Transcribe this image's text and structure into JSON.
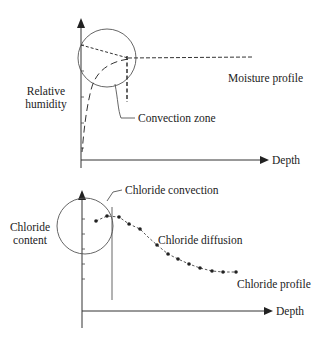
{
  "diagram": {
    "top_panel": {
      "y_axis_label_line1": "Relative",
      "y_axis_label_line2": "humidity",
      "x_axis_label": "Depth",
      "curve_label": "Moisture profile",
      "zone_label": "Convection zone"
    },
    "bottom_panel": {
      "y_axis_label_line1": "Chloride",
      "y_axis_label_line2": "content",
      "x_axis_label": "Depth",
      "convection_label": "Chloride convection",
      "diffusion_label": "Chloride diffusion",
      "curve_label": "Chloride profile",
      "profile_points": [
        [
          96,
          221
        ],
        [
          107,
          216
        ],
        [
          119,
          217
        ],
        [
          129,
          224
        ],
        [
          140,
          229
        ],
        [
          148,
          237
        ],
        [
          157,
          245
        ],
        [
          168,
          254
        ],
        [
          178,
          259
        ],
        [
          189,
          264
        ],
        [
          200,
          268
        ],
        [
          212,
          271
        ],
        [
          223,
          272
        ],
        [
          236,
          272
        ]
      ]
    },
    "colors": {
      "line": "#333333",
      "text": "#222222",
      "background": "#ffffff"
    }
  }
}
